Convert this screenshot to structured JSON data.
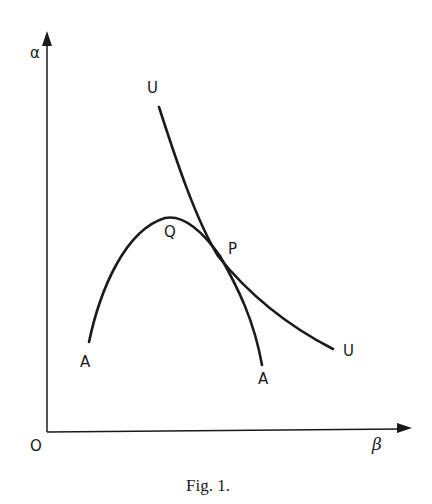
{
  "figure": {
    "caption": "Fig. 1.",
    "axes": {
      "y_label": "α",
      "x_label": "β",
      "origin_label": "O"
    },
    "curves": [
      {
        "name": "U",
        "labels": [
          "U",
          "U"
        ],
        "description": "convex indifference-type curve descending from upper left to lower right"
      },
      {
        "name": "A",
        "labels": [
          "A",
          "A"
        ],
        "description": "concave hump-shaped curve rising to a maximum at Q then falling steeply"
      }
    ],
    "points": {
      "Q": "Q",
      "P": "P"
    },
    "labels": {
      "u_top": "U",
      "u_right": "U",
      "a_left": "A",
      "a_right": "A",
      "q": "Q",
      "p": "P"
    },
    "colors": {
      "ink": "#1a1a1a",
      "background": "#ffffff"
    }
  }
}
